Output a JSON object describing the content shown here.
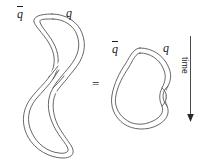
{
  "figure": {
    "kind": "physics-worldsheet-diagram",
    "caption_text": "",
    "relation_symbol": "=",
    "background_color": "#ffffff",
    "stroke_color": "#55565a",
    "label_color": "#1b1b1d",
    "left_diagram": {
      "name": "figure-eight-band",
      "description": "closed band crossing itself once forming a figure eight",
      "labels": {
        "antiquark": "q",
        "antiquark_has_overbar": true,
        "quark": "q"
      }
    },
    "right_diagram": {
      "name": "single-loop-band-with-twist",
      "description": "closed band forming one rounded loop with a small twist on the right edge",
      "labels": {
        "antiquark": "q",
        "antiquark_has_overbar": true,
        "quark": "q"
      }
    },
    "time_axis": {
      "label": "time",
      "direction": "down",
      "arrowhead": "down-arrow-icon"
    }
  }
}
